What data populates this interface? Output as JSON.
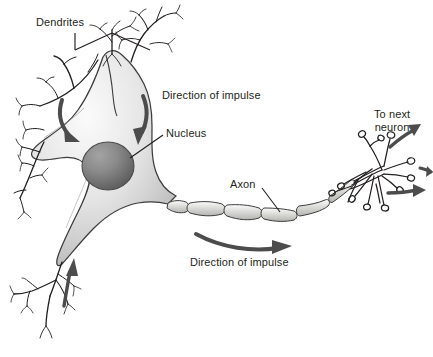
{
  "diagram": {
    "background_color": "#ffffff",
    "ink_color": "#231f20",
    "membrane_fill_light": "#f2f2f2",
    "membrane_fill_mid": "#c9c9c9",
    "membrane_fill_dark": "#9a9a9a",
    "nucleus_color_light": "#8e8e8e",
    "nucleus_color_dark": "#4a4a4a",
    "myelin_fill": "#d8d8d6",
    "arrow_color": "#4c4c4c"
  },
  "labels": {
    "dendrites": "Dendrites",
    "direction_of_impulse_top": "Direction of impulse",
    "nucleus": "Nucleus",
    "axon": "Axon",
    "direction_of_impulse_bottom": "Direction of impulse",
    "to_next_neuron_line1": "To next",
    "to_next_neuron_line2": "neuron"
  },
  "parts": {
    "soma": "cell-body",
    "nucleus": "nucleus",
    "dendrites_count_labeled": 5,
    "myelin_segments": 7,
    "axon_terminal_buttons": 12
  }
}
